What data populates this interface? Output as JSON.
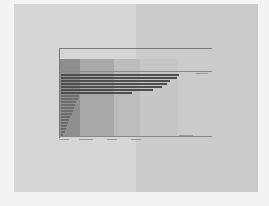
{
  "page": {
    "background_left": "#d6d6d6",
    "background_right": "#cbcbcb"
  },
  "chart_data": {
    "type": "bar",
    "orientation": "horizontal",
    "title": "",
    "xlabel": "",
    "ylabel": "",
    "note": "Text labels are illegible at the screenshot resolution; values are estimated relative bar lengths (0-100 scale).",
    "categories": [
      "",
      "",
      "",
      "",
      "",
      "",
      "",
      "",
      "",
      "",
      "",
      "",
      "",
      "",
      "",
      "",
      "",
      "",
      "",
      "",
      ""
    ],
    "values": [
      100,
      98,
      92,
      90,
      86,
      78,
      60,
      15,
      14,
      13,
      12,
      11,
      10,
      9,
      8,
      7,
      6,
      5,
      4,
      3,
      2
    ],
    "bands": [
      {
        "x_start": 0,
        "x_end": 17,
        "color": "#8e8e8e"
      },
      {
        "x_start": 17,
        "x_end": 46,
        "color": "#a9a9a9"
      },
      {
        "x_start": 46,
        "x_end": 68,
        "color": "#bdbdbd"
      },
      {
        "x_start": 68,
        "x_end": 100,
        "color": "#c6c6c6"
      }
    ],
    "grid": false,
    "legend_position": "right"
  }
}
